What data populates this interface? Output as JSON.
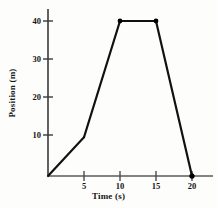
{
  "chart_data": {
    "type": "line",
    "title": "",
    "xlabel": "Time  (s)",
    "ylabel": "Position (m)",
    "x": [
      0,
      5,
      10,
      15,
      20
    ],
    "values": [
      0,
      10,
      40,
      40,
      0
    ],
    "series": [
      {
        "name": "Position",
        "x": [
          0,
          5,
          10,
          15,
          20
        ],
        "values": [
          0,
          10,
          40,
          40,
          0
        ]
      }
    ],
    "xlim": [
      0,
      22
    ],
    "ylim": [
      0,
      45
    ],
    "xticks": [
      "5",
      "10",
      "15",
      "20"
    ],
    "xtick_values": [
      5,
      10,
      15,
      20
    ],
    "yticks": [
      "10",
      "20",
      "30",
      "40"
    ],
    "ytick_values": [
      10,
      20,
      30,
      40
    ],
    "grid": false,
    "legend": false,
    "markers": "filled-circle",
    "line_color": "#111111",
    "axis_color": "#333333"
  },
  "axes": {
    "y_title": "Position (m)",
    "x_title": "Time  (s)",
    "y_tick_labels": [
      "40",
      "30",
      "20",
      "10"
    ],
    "x_tick_labels": [
      "5",
      "10",
      "15",
      "20"
    ]
  }
}
